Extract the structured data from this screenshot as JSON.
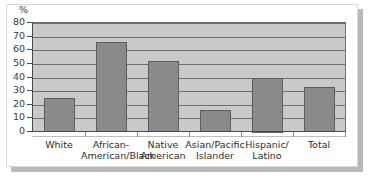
{
  "figure": {
    "unit_label": "%",
    "accent_color": "#8a8a8a",
    "plot_bg_color": "#c9c9c9",
    "axis_color": "#4a4a4a"
  },
  "chart_data": {
    "type": "bar",
    "title": "",
    "xlabel": "",
    "ylabel": "%",
    "ylim": [
      0,
      80
    ],
    "yticks": [
      0,
      10,
      20,
      30,
      40,
      50,
      60,
      70,
      80
    ],
    "ytick_labels": [
      "0",
      "10",
      "20",
      "30",
      "40",
      "50",
      "60",
      "70",
      "80"
    ],
    "grid": true,
    "legend": "none",
    "categories": [
      "White",
      "African-American/Black",
      "Native American",
      "Asian/Pacific Islander",
      "Hispanic/Latino",
      "Total"
    ],
    "category_lines": [
      [
        "White",
        ""
      ],
      [
        "African-",
        "American/Black"
      ],
      [
        "Native",
        "American"
      ],
      [
        "Asian/Pacific",
        "Islander"
      ],
      [
        "Hispanic/",
        "Latino"
      ],
      [
        "Total",
        ""
      ]
    ],
    "values": [
      25,
      66,
      52,
      16,
      40,
      33
    ]
  }
}
